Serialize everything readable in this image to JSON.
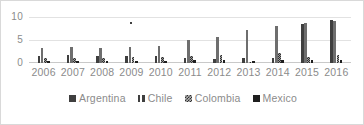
{
  "chart_data": {
    "type": "bar",
    "title": "",
    "subtitle": "",
    "xlabel": "",
    "ylabel": "",
    "categories": [
      "2006",
      "2007",
      "2008",
      "2009",
      "2010",
      "2011",
      "2012",
      "2013",
      "2014",
      "2015",
      "2016"
    ],
    "ylim": [
      0,
      10
    ],
    "yticks": [
      0,
      5,
      10
    ],
    "ytick_labels": [
      "0",
      "5",
      "10"
    ],
    "grid": true,
    "legend_position": "bottom",
    "series": [
      {
        "name": "Argentina",
        "color": "#3f3f3f",
        "values": [
          1.6,
          1.7,
          1.6,
          1.6,
          1.5,
          1.0,
          0.9,
          1.0,
          1.1,
          8.5,
          9.3
        ]
      },
      {
        "name": "Chile",
        "color": "#6e6e6e",
        "values": [
          3.2,
          3.4,
          3.3,
          3.5,
          3.6,
          5.0,
          5.6,
          7.1,
          8.0,
          8.6,
          9.2
        ]
      },
      {
        "name": "Colombia",
        "color": "#9a9a9a",
        "values": [
          1.1,
          1.1,
          1.1,
          1.2,
          1.3,
          1.5,
          1.8,
          0.2,
          2.1,
          1.4,
          1.7
        ]
      },
      {
        "name": "Mexico",
        "color": "#1f1f1f",
        "values": [
          0.5,
          0.5,
          0.5,
          0.5,
          0.5,
          0.6,
          0.6,
          0.5,
          0.6,
          0.6,
          0.6
        ]
      }
    ],
    "annotations": [
      {
        "label": "",
        "category": "2009",
        "value": 9.0,
        "series": "Argentina"
      }
    ]
  },
  "legend": {
    "items": [
      {
        "label": "Argentina",
        "swatch": "argentina"
      },
      {
        "label": "Chile",
        "swatch": "chile"
      },
      {
        "label": "Colombia",
        "swatch": "colombia"
      },
      {
        "label": "Mexico",
        "swatch": "mexico"
      }
    ]
  }
}
